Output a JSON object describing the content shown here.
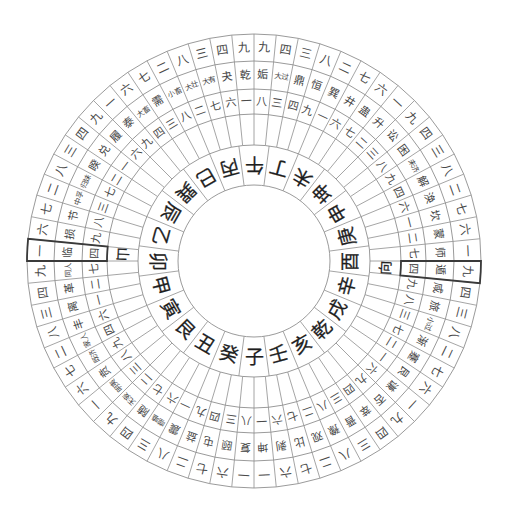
{
  "compass": {
    "colors": {
      "background": "#ffffff",
      "line": "#8e8e8e",
      "text": "#444444",
      "mountain_text": "#1e1e1e",
      "highlight_border": "#3a3a3a"
    },
    "hexagrams": [
      {
        "name": "姤",
        "gua_shu": "九",
        "gua_yun": "八"
      },
      {
        "name": "大过",
        "gua_shu": "四",
        "gua_yun": "三"
      },
      {
        "name": "鼎",
        "gua_shu": "三",
        "gua_yun": "四"
      },
      {
        "name": "恒",
        "gua_shu": "八",
        "gua_yun": "九"
      },
      {
        "name": "巽",
        "gua_shu": "二",
        "gua_yun": "一"
      },
      {
        "name": "井",
        "gua_shu": "七",
        "gua_yun": "六"
      },
      {
        "name": "蛊",
        "gua_shu": "六",
        "gua_yun": "七"
      },
      {
        "name": "升",
        "gua_shu": "一",
        "gua_yun": "二"
      },
      {
        "name": "讼",
        "gua_shu": "九",
        "gua_yun": "三"
      },
      {
        "name": "困",
        "gua_shu": "四",
        "gua_yun": "八"
      },
      {
        "name": "未济",
        "gua_shu": "三",
        "gua_yun": "九"
      },
      {
        "name": "解",
        "gua_shu": "八",
        "gua_yun": "四"
      },
      {
        "name": "涣",
        "gua_shu": "二",
        "gua_yun": "六"
      },
      {
        "name": "坎",
        "gua_shu": "七",
        "gua_yun": "一"
      },
      {
        "name": "蒙",
        "gua_shu": "六",
        "gua_yun": "二"
      },
      {
        "name": "师",
        "gua_shu": "一",
        "gua_yun": "七"
      },
      {
        "name": "遁",
        "gua_shu": "九",
        "gua_yun": "四"
      },
      {
        "name": "咸",
        "gua_shu": "四",
        "gua_yun": "九"
      },
      {
        "name": "旅",
        "gua_shu": "三",
        "gua_yun": "八"
      },
      {
        "name": "小过",
        "gua_shu": "八",
        "gua_yun": "三"
      },
      {
        "name": "渐",
        "gua_shu": "二",
        "gua_yun": "七"
      },
      {
        "name": "蹇",
        "gua_shu": "七",
        "gua_yun": "二"
      },
      {
        "name": "艮",
        "gua_shu": "六",
        "gua_yun": "一"
      },
      {
        "name": "谦",
        "gua_shu": "一",
        "gua_yun": "六"
      },
      {
        "name": "否",
        "gua_shu": "九",
        "gua_yun": "九"
      },
      {
        "name": "萃",
        "gua_shu": "四",
        "gua_yun": "四"
      },
      {
        "name": "晋",
        "gua_shu": "三",
        "gua_yun": "三"
      },
      {
        "name": "豫",
        "gua_shu": "八",
        "gua_yun": "八"
      },
      {
        "name": "观",
        "gua_shu": "二",
        "gua_yun": "二"
      },
      {
        "name": "比",
        "gua_shu": "七",
        "gua_yun": "七"
      },
      {
        "name": "剥",
        "gua_shu": "六",
        "gua_yun": "六"
      },
      {
        "name": "坤",
        "gua_shu": "一",
        "gua_yun": "一"
      },
      {
        "name": "复",
        "gua_shu": "一",
        "gua_yun": "八"
      },
      {
        "name": "颐",
        "gua_shu": "六",
        "gua_yun": "三"
      },
      {
        "name": "屯",
        "gua_shu": "七",
        "gua_yun": "四"
      },
      {
        "name": "益",
        "gua_shu": "二",
        "gua_yun": "九"
      },
      {
        "name": "震",
        "gua_shu": "八",
        "gua_yun": "一"
      },
      {
        "name": "噬嗑",
        "gua_shu": "三",
        "gua_yun": "六"
      },
      {
        "name": "随",
        "gua_shu": "四",
        "gua_yun": "七"
      },
      {
        "name": "无妄",
        "gua_shu": "九",
        "gua_yun": "二"
      },
      {
        "name": "明夷",
        "gua_shu": "一",
        "gua_yun": "三"
      },
      {
        "name": "贲",
        "gua_shu": "六",
        "gua_yun": "八"
      },
      {
        "name": "既济",
        "gua_shu": "七",
        "gua_yun": "九"
      },
      {
        "name": "家人",
        "gua_shu": "二",
        "gua_yun": "四"
      },
      {
        "name": "丰",
        "gua_shu": "八",
        "gua_yun": "六"
      },
      {
        "name": "离",
        "gua_shu": "三",
        "gua_yun": "一"
      },
      {
        "name": "革",
        "gua_shu": "四",
        "gua_yun": "二"
      },
      {
        "name": "同人",
        "gua_shu": "九",
        "gua_yun": "七"
      },
      {
        "name": "临",
        "gua_shu": "一",
        "gua_yun": "四"
      },
      {
        "name": "损",
        "gua_shu": "六",
        "gua_yun": "九"
      },
      {
        "name": "节",
        "gua_shu": "七",
        "gua_yun": "八"
      },
      {
        "name": "中孚",
        "gua_shu": "二",
        "gua_yun": "三"
      },
      {
        "name": "归妹",
        "gua_shu": "八",
        "gua_yun": "七"
      },
      {
        "name": "睽",
        "gua_shu": "三",
        "gua_yun": "二"
      },
      {
        "name": "兑",
        "gua_shu": "四",
        "gua_yun": "一"
      },
      {
        "name": "履",
        "gua_shu": "九",
        "gua_yun": "六"
      },
      {
        "name": "泰",
        "gua_shu": "一",
        "gua_yun": "九"
      },
      {
        "name": "大畜",
        "gua_shu": "六",
        "gua_yun": "四"
      },
      {
        "name": "需",
        "gua_shu": "七",
        "gua_yun": "三"
      },
      {
        "name": "小畜",
        "gua_shu": "二",
        "gua_yun": "八"
      },
      {
        "name": "大壮",
        "gua_shu": "八",
        "gua_yun": "二"
      },
      {
        "name": "大有",
        "gua_shu": "三",
        "gua_yun": "七"
      },
      {
        "name": "夬",
        "gua_shu": "四",
        "gua_yun": "六"
      },
      {
        "name": "乾",
        "gua_shu": "九",
        "gua_yun": "一"
      }
    ],
    "mountains": [
      "午",
      "丁",
      "未",
      "坤",
      "申",
      "庚",
      "酉",
      "辛",
      "戌",
      "乾",
      "亥",
      "壬",
      "子",
      "癸",
      "丑",
      "艮",
      "寅",
      "甲",
      "卯",
      "乙",
      "辰",
      "巽",
      "巳",
      "丙"
    ],
    "markers": [
      {
        "role": "sitting",
        "label": "山",
        "hexagram_index": 48
      },
      {
        "role": "facing",
        "label": "向",
        "hexagram_index": 16
      }
    ]
  }
}
